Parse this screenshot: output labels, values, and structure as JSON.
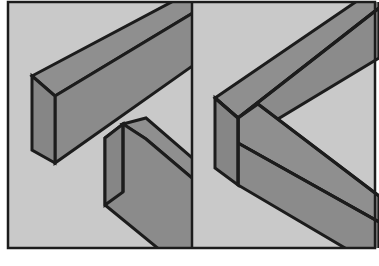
{
  "figure": {
    "title": "Two-panel isometric illustration of rectangular beams",
    "panel_count": 2,
    "background_color": "#c9c9c9",
    "beam_fill_color": "#8b8b8b",
    "beam_top_color": "#8f8f8f",
    "beam_end_color": "#868686",
    "outline_color": "#1c1c1c",
    "page_color": "#ffffff"
  },
  "panels": [
    {
      "id": "left",
      "name": "separated-beams-panel",
      "label": "",
      "beam_count": 2,
      "beams": [
        {
          "id": "upper-left-beam",
          "name": "upper-beam",
          "orientation": "descending-right-to-left",
          "end_cap_visible": true,
          "end_cap_position": "left"
        },
        {
          "id": "lower-left-beam",
          "name": "lower-beam",
          "orientation": "descending-left-to-right",
          "end_cap_visible": true,
          "end_cap_position": "top-left"
        }
      ]
    },
    {
      "id": "right",
      "name": "joined-chevron-panel",
      "label": "",
      "beam_count": 2,
      "joint_type": "mitre",
      "beams": [
        {
          "id": "upper-right-arm",
          "name": "upper-arm",
          "orientation": "ascending-to-right",
          "end_cap_visible": false,
          "end_cap_position": "none"
        },
        {
          "id": "lower-right-arm",
          "name": "lower-arm",
          "orientation": "descending-to-right",
          "end_cap_visible": false,
          "end_cap_position": "none"
        }
      ],
      "corner": {
        "name": "mitre-corner",
        "end_cap_visible": true,
        "end_cap_position": "left"
      }
    }
  ],
  "geometry": {
    "canvas_width": 379,
    "canvas_height": 266,
    "frame": {
      "x": 8,
      "y": 2,
      "width": 367,
      "height": 246
    },
    "divider_x": 192
  }
}
